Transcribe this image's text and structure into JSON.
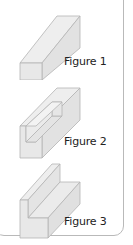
{
  "figures": [
    {
      "label": "Figure 1",
      "shape": "rectangular-prism"
    },
    {
      "label": "Figure 2",
      "shape": "prism-with-rectangular-notch"
    },
    {
      "label": "Figure 3",
      "shape": "l-shaped-prism"
    }
  ],
  "colors": {
    "face_front": "#e6e6e6",
    "face_top": "#ededed",
    "face_side": "#dedede",
    "edge": "#b4b4b4",
    "border": "#b9b9b9",
    "text": "#222222"
  }
}
